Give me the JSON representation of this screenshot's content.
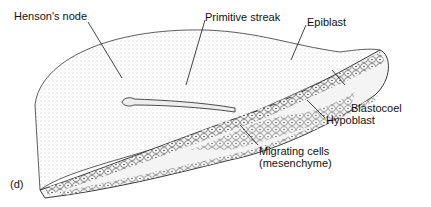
{
  "labels": {
    "hensons_node": "Henson's node",
    "primitive_streak": "Primitive streak",
    "epiblast": "Epiblast",
    "blastocoel": "Blastocoel",
    "hypoblast": "Hypoblast",
    "migrating_cells_1": "Migrating cells",
    "migrating_cells_2": "(mesenchyme)",
    "panel": "(d)"
  }
}
